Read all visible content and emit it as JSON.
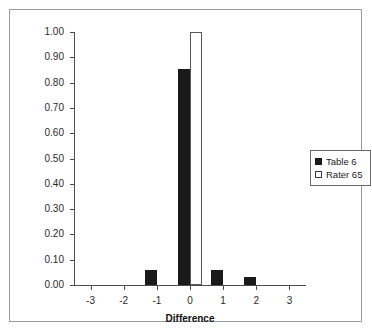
{
  "chart_data": {
    "type": "bar",
    "title": "",
    "subtitle": "",
    "xlabel": "Difference",
    "ylabel": "",
    "categories": [
      -3,
      -2,
      -1,
      0,
      1,
      2,
      3
    ],
    "xtick_labels": [
      "-3",
      "-2",
      "-1",
      "0",
      "1",
      "2",
      "3"
    ],
    "xlim": [
      -3.5,
      3.5
    ],
    "ylim": [
      0.0,
      1.0
    ],
    "ytick_labels": [
      "1.00",
      "0.90",
      "0.80",
      "0.70",
      "0.60",
      "0.50",
      "0.40",
      "0.30",
      "0.20",
      "0.10",
      "0.00"
    ],
    "ytick_values": [
      1.0,
      0.9,
      0.8,
      0.7,
      0.6,
      0.5,
      0.4,
      0.3,
      0.2,
      0.1,
      0.0
    ],
    "grid": false,
    "legend_position": "right",
    "series": [
      {
        "name": "Table 6",
        "color": "#1a1a1a",
        "values": [
          0.0,
          0.0,
          0.06,
          0.855,
          0.06,
          0.03,
          0.0
        ]
      },
      {
        "name": "Rater 65",
        "color": "#ffffff",
        "values": [
          0.0,
          0.0,
          0.0,
          1.0,
          0.0,
          0.0,
          0.0
        ]
      }
    ]
  },
  "legend": {
    "entries": [
      {
        "label": "Table 6"
      },
      {
        "label": "Rater 65"
      }
    ]
  },
  "colors": {
    "series_0": "#1a1a1a",
    "series_1": "#ffffff",
    "axis": "#4d4d4d",
    "frame": "#9a9a9a",
    "text": "#2b2b2b"
  }
}
